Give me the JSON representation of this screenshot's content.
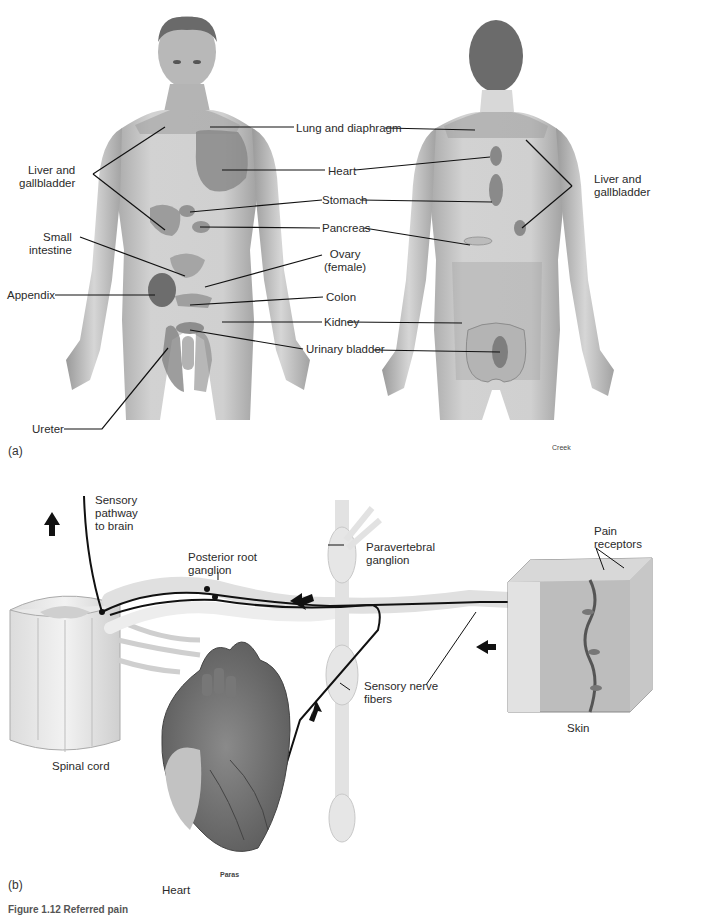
{
  "figure": {
    "panel_a_letter": "(a)",
    "panel_b_letter": "(b)",
    "caption_fragment": "Figure 1.12  Referred pain",
    "credits": {
      "panel_a": "Creek",
      "panel_b": "Paras"
    }
  },
  "panel_a": {
    "left_labels": [
      {
        "id": "liver_left",
        "text": "Liver and\ngallbladder"
      },
      {
        "id": "small_intestine",
        "text": "Small\nintestine"
      },
      {
        "id": "appendix",
        "text": "Appendix"
      },
      {
        "id": "ureter",
        "text": "Ureter"
      }
    ],
    "center_labels": [
      {
        "id": "lung",
        "text": "Lung and diaphragm"
      },
      {
        "id": "heart",
        "text": "Heart"
      },
      {
        "id": "stomach",
        "text": "Stomach"
      },
      {
        "id": "pancreas",
        "text": "Pancreas"
      },
      {
        "id": "ovary",
        "text": "Ovary\n(female)"
      },
      {
        "id": "colon",
        "text": "Colon"
      },
      {
        "id": "kidney",
        "text": "Kidney"
      },
      {
        "id": "urinary_bladder",
        "text": "Urinary bladder"
      }
    ],
    "right_labels": [
      {
        "id": "liver_right",
        "text": "Liver and\ngallbladder"
      }
    ]
  },
  "panel_b": {
    "labels": {
      "sensory_pathway": "Sensory\npathway\nto brain",
      "posterior_root": "Posterior root\nganglion",
      "paravertebral": "Paravertebral\nganglion",
      "pain_receptors": "Pain\nreceptors",
      "sensory_nerve": "Sensory nerve\nfibers",
      "skin": "Skin",
      "spinal_cord": "Spinal cord",
      "heart": "Heart"
    }
  },
  "colors": {
    "skin_tone": "#c9c9c9",
    "skin_shade": "#a8a8a8",
    "organ_zone": "#8c8c8c",
    "nerve": "#1a1a1a",
    "ganglion": "#e4e4e4"
  }
}
